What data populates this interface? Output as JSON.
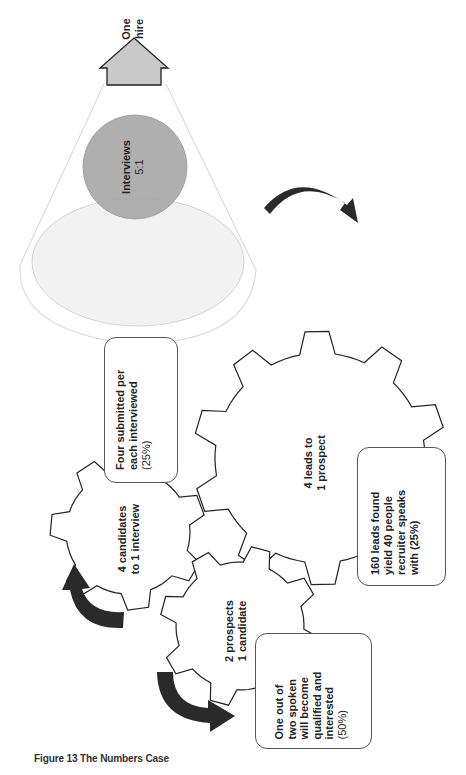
{
  "figure": {
    "caption": "Figure 13 The Numbers Case"
  },
  "funnel": {
    "top_label": {
      "line1": "One",
      "line2": "hire"
    },
    "interviews": {
      "line1": "Interviews",
      "line2": "5:1"
    },
    "colors": {
      "arrow_fill": "#c8c8c8",
      "interviews_fill": "#a9a9a9",
      "ellipse_fill": "#f1f1f1",
      "funnel_stroke": "#d9d9d9"
    }
  },
  "gears": [
    {
      "id": "leads",
      "line1": "4 leads to",
      "line2": "1 prospect"
    },
    {
      "id": "prospects",
      "line1": "2 prospects",
      "line2": "1 candidate"
    },
    {
      "id": "candidates",
      "line1": "4 candidates",
      "line2": "to 1 interview"
    }
  ],
  "notes": {
    "submitted": {
      "lines": [
        "Four submitted per",
        "each interviewed",
        "(25%)"
      ]
    },
    "leads": {
      "lines": [
        "160 leads found",
        "yield 40 people",
        "recruiter speaks",
        "with (25%)"
      ]
    },
    "spoken": {
      "lines": [
        "One out of",
        "two spoken",
        "will become",
        "qualified and",
        "interested",
        "(50%)"
      ]
    }
  },
  "rotation_arrows": [
    {
      "id": "arrow-top-right",
      "direction": "clockwise"
    },
    {
      "id": "arrow-left-middle",
      "direction": "counterclockwise"
    },
    {
      "id": "arrow-bottom-left",
      "direction": "counterclockwise"
    }
  ],
  "colors": {
    "gear_stroke": "#222222",
    "rotation_arrow": "#2a2a2a",
    "note_border": "#555555"
  }
}
